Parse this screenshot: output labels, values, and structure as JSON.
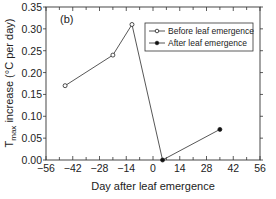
{
  "chart_data": {
    "type": "line",
    "panel_label": "(b)",
    "xlabel": "Day after leaf emergence",
    "ylabel_main": "T",
    "ylabel_sub": "max",
    "ylabel_rest": " increase (°C per day)",
    "xlim": [
      -56,
      56
    ],
    "ylim": [
      0,
      0.35
    ],
    "xticks": [
      -56,
      -42,
      -28,
      -14,
      0,
      14,
      28,
      42,
      56
    ],
    "xtick_labels": [
      "−56",
      "−42",
      "−28",
      "−14",
      "0",
      "14",
      "28",
      "42",
      "56"
    ],
    "yticks": [
      0,
      0.05,
      0.1,
      0.15,
      0.2,
      0.25,
      0.3,
      0.35
    ],
    "ytick_labels": [
      "0.00",
      "0.05",
      "0.10",
      "0.15",
      "0.20",
      "0.25",
      "0.30",
      "0.35"
    ],
    "grid": false,
    "legend_position": "upper right",
    "series": [
      {
        "name": "Before leaf emergence",
        "marker": "open-circle",
        "x": [
          -46,
          -21,
          -11
        ],
        "y": [
          0.17,
          0.24,
          0.31
        ]
      },
      {
        "name": "After leaf emergence",
        "marker": "filled-circle",
        "x": [
          5,
          35
        ],
        "y": [
          0.0,
          0.07
        ]
      }
    ],
    "connector": {
      "from": [
        -11,
        0.31
      ],
      "to": [
        5,
        0.0
      ]
    }
  }
}
